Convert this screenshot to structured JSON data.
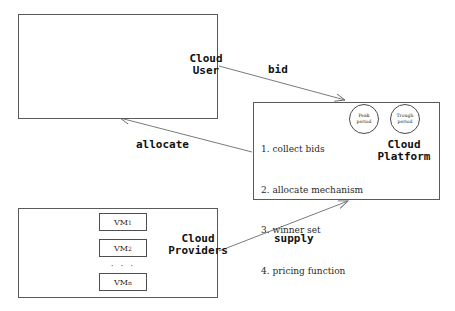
{
  "diagram": {
    "actors": {
      "cloud_user": {
        "label": "Cloud\nUser",
        "figure_count": 3,
        "figure_icon": "stick-figure-icon"
      },
      "cloud_providers": {
        "label": "Cloud\nProviders",
        "avatar_icon": "person-avatar-icon",
        "vm_items": [
          {
            "name": "VM",
            "subscript": "1"
          },
          {
            "name": "VM",
            "subscript": "2"
          },
          {
            "name": "VM",
            "subscript": "n"
          }
        ],
        "ellipsis": "· · ·"
      },
      "cloud_platform": {
        "label": "Cloud\nPlatform",
        "steps": [
          "1. collect bids",
          "2. allocate mechanism",
          "3. winner set",
          "4. pricing function"
        ],
        "periods": [
          {
            "name": "peak-period",
            "line1": "Peak",
            "line2": "period"
          },
          {
            "name": "trough-period",
            "line1": "Trough",
            "line2": "period"
          }
        ]
      }
    },
    "edges": [
      {
        "name": "bid",
        "label": "bid",
        "from": "cloud-user",
        "to": "cloud-platform"
      },
      {
        "name": "allocate",
        "label": "allocate",
        "from": "cloud-platform",
        "to": "cloud-user"
      },
      {
        "name": "supply",
        "label": "supply",
        "from": "cloud-providers",
        "to": "cloud-platform"
      }
    ],
    "colors": {
      "stroke": "#5a5a5a",
      "arrow": "#6b6b6b",
      "text": "#111111",
      "avatar_fill": "#efefef",
      "avatar_stroke": "#111111",
      "background": "#ffffff"
    }
  }
}
